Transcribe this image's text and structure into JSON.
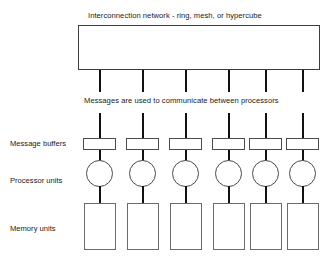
{
  "diagram": {
    "network_caption": "Interconnection network - ring, mesh, or hypercube",
    "messages_caption": "Messages are used to communicate between processors",
    "row_labels": {
      "message_buffers": "Message buffers",
      "processor_units": "Processor  units",
      "memory_units": "Memory units"
    },
    "node_count": 6,
    "columns": [
      {
        "index": 1,
        "x": 83
      },
      {
        "index": 2,
        "x": 126
      },
      {
        "index": 3,
        "x": 169
      },
      {
        "index": 4,
        "x": 212
      },
      {
        "index": 5,
        "x": 249
      },
      {
        "index": 6,
        "x": 286
      }
    ],
    "colors": {
      "background": "#ffffff",
      "stroke": "#3d3d3d",
      "line": "#111111",
      "text": "#1a1a1a",
      "memory_stroke": "#6b6b6b"
    }
  }
}
